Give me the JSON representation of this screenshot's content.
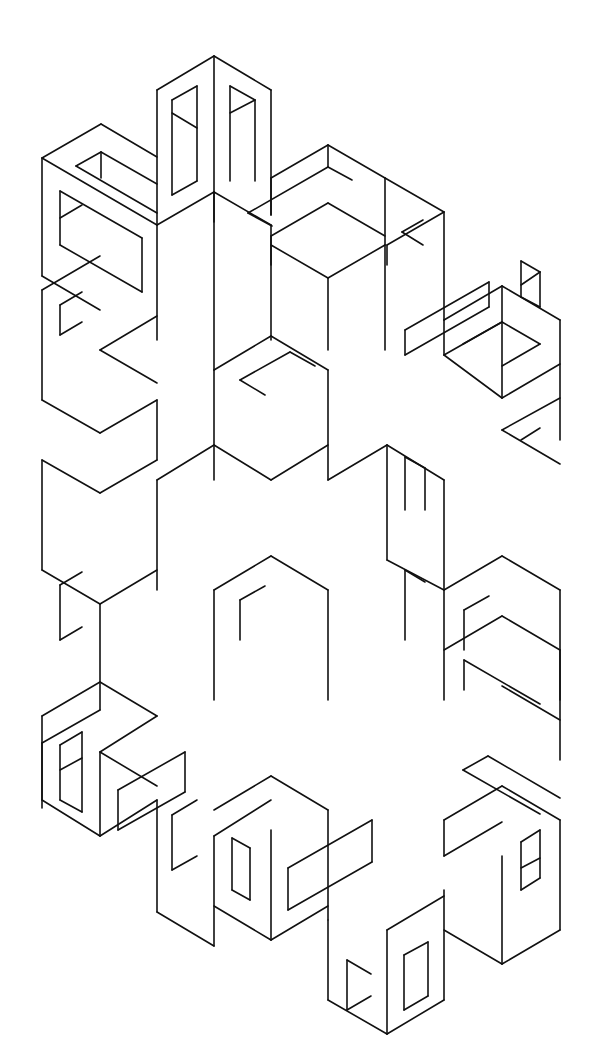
{
  "artwork": {
    "subject": "isometric impossible interlocking open-frame blocks",
    "style": "black line art on white",
    "colors": {
      "background": "#ffffff",
      "stroke": "#111111"
    },
    "lines": [
      [
        214,
        56,
        157,
        90
      ],
      [
        214,
        56,
        271,
        90
      ],
      [
        214,
        56,
        214,
        222
      ],
      [
        157,
        90,
        157,
        225
      ],
      [
        271,
        90,
        271,
        215
      ],
      [
        172,
        100,
        197,
        86
      ],
      [
        172,
        100,
        172,
        195
      ],
      [
        172,
        195,
        197,
        181
      ],
      [
        197,
        86,
        197,
        181
      ],
      [
        172,
        113,
        197,
        128
      ],
      [
        230,
        86,
        255,
        100
      ],
      [
        230,
        86,
        230,
        181
      ],
      [
        255,
        100,
        255,
        181
      ],
      [
        230,
        113,
        255,
        100
      ],
      [
        42,
        158,
        101,
        124
      ],
      [
        101,
        124,
        157,
        157
      ],
      [
        42,
        158,
        42,
        276
      ],
      [
        42,
        158,
        157,
        225
      ],
      [
        42,
        276,
        100,
        310
      ],
      [
        76,
        166,
        101,
        152
      ],
      [
        101,
        152,
        157,
        184
      ],
      [
        76,
        166,
        157,
        213
      ],
      [
        101,
        152,
        101,
        178
      ],
      [
        60,
        191,
        60,
        245
      ],
      [
        60,
        191,
        142,
        238
      ],
      [
        60,
        245,
        142,
        292
      ],
      [
        142,
        238,
        142,
        292
      ],
      [
        60,
        218,
        82,
        205
      ],
      [
        157,
        225,
        214,
        192
      ],
      [
        214,
        192,
        271,
        225
      ],
      [
        157,
        225,
        157,
        340
      ],
      [
        271,
        225,
        271,
        340
      ],
      [
        214,
        192,
        214,
        370
      ],
      [
        328,
        145,
        385,
        178
      ],
      [
        271,
        178,
        328,
        145
      ],
      [
        271,
        178,
        271,
        215
      ],
      [
        385,
        178,
        444,
        212
      ],
      [
        385,
        178,
        385,
        245
      ],
      [
        248,
        213,
        328,
        167
      ],
      [
        248,
        213,
        272,
        226
      ],
      [
        328,
        167,
        352,
        180
      ],
      [
        328,
        167,
        328,
        145
      ],
      [
        271,
        236,
        328,
        203
      ],
      [
        328,
        203,
        385,
        236
      ],
      [
        271,
        236,
        271,
        265
      ],
      [
        385,
        245,
        328,
        278
      ],
      [
        328,
        278,
        271,
        245
      ],
      [
        328,
        278,
        328,
        350
      ],
      [
        385,
        245,
        385,
        350
      ],
      [
        444,
        212,
        444,
        320
      ],
      [
        387,
        245,
        444,
        212
      ],
      [
        387,
        245,
        387,
        265
      ],
      [
        402,
        232,
        423,
        220
      ],
      [
        402,
        232,
        423,
        245
      ],
      [
        444,
        320,
        502,
        286
      ],
      [
        502,
        286,
        560,
        320
      ],
      [
        560,
        320,
        560,
        440
      ],
      [
        502,
        286,
        502,
        398
      ],
      [
        405,
        330,
        489,
        282
      ],
      [
        405,
        330,
        405,
        355
      ],
      [
        405,
        355,
        489,
        307
      ],
      [
        489,
        282,
        489,
        307
      ],
      [
        521,
        261,
        540,
        272
      ],
      [
        521,
        261,
        521,
        297
      ],
      [
        521,
        297,
        540,
        307
      ],
      [
        540,
        272,
        540,
        307
      ],
      [
        521,
        285,
        540,
        272
      ],
      [
        444,
        320,
        444,
        355
      ],
      [
        444,
        355,
        502,
        398
      ],
      [
        502,
        398,
        560,
        364
      ],
      [
        463,
        344,
        502,
        322
      ],
      [
        502,
        322,
        540,
        344
      ],
      [
        502,
        366,
        540,
        344
      ],
      [
        42,
        290,
        42,
        400
      ],
      [
        42,
        400,
        100,
        433
      ],
      [
        100,
        433,
        157,
        400
      ],
      [
        42,
        290,
        100,
        256
      ],
      [
        60,
        305,
        82,
        292
      ],
      [
        60,
        305,
        60,
        335
      ],
      [
        60,
        335,
        82,
        322
      ],
      [
        100,
        350,
        157,
        316
      ],
      [
        100,
        350,
        157,
        383
      ],
      [
        157,
        400,
        157,
        460
      ],
      [
        157,
        460,
        100,
        493
      ],
      [
        100,
        493,
        42,
        460
      ],
      [
        42,
        460,
        42,
        570
      ],
      [
        214,
        370,
        271,
        336
      ],
      [
        271,
        336,
        328,
        370
      ],
      [
        214,
        370,
        214,
        480
      ],
      [
        328,
        370,
        328,
        480
      ],
      [
        240,
        380,
        290,
        352
      ],
      [
        240,
        380,
        265,
        395
      ],
      [
        290,
        352,
        315,
        366
      ],
      [
        328,
        480,
        387,
        445
      ],
      [
        387,
        445,
        444,
        480
      ],
      [
        444,
        480,
        444,
        590
      ],
      [
        387,
        445,
        387,
        560
      ],
      [
        405,
        457,
        425,
        468
      ],
      [
        405,
        457,
        405,
        510
      ],
      [
        425,
        468,
        425,
        510
      ],
      [
        444,
        355,
        502,
        322
      ],
      [
        502,
        430,
        560,
        398
      ],
      [
        502,
        430,
        560,
        464
      ],
      [
        521,
        440,
        540,
        428
      ],
      [
        271,
        480,
        328,
        445
      ],
      [
        271,
        480,
        214,
        445
      ],
      [
        214,
        445,
        157,
        480
      ],
      [
        157,
        480,
        157,
        590
      ],
      [
        42,
        570,
        100,
        604
      ],
      [
        100,
        604,
        157,
        570
      ],
      [
        60,
        585,
        82,
        572
      ],
      [
        60,
        585,
        60,
        640
      ],
      [
        60,
        640,
        82,
        627
      ],
      [
        100,
        604,
        100,
        710
      ],
      [
        100,
        710,
        42,
        743
      ],
      [
        42,
        743,
        42,
        808
      ],
      [
        214,
        590,
        271,
        556
      ],
      [
        271,
        556,
        328,
        590
      ],
      [
        214,
        590,
        214,
        700
      ],
      [
        328,
        590,
        328,
        700
      ],
      [
        240,
        600,
        265,
        586
      ],
      [
        240,
        600,
        240,
        640
      ],
      [
        387,
        560,
        444,
        590
      ],
      [
        444,
        590,
        502,
        556
      ],
      [
        502,
        556,
        560,
        590
      ],
      [
        560,
        590,
        560,
        700
      ],
      [
        405,
        570,
        425,
        582
      ],
      [
        405,
        570,
        405,
        640
      ],
      [
        444,
        590,
        444,
        700
      ],
      [
        464,
        610,
        489,
        596
      ],
      [
        464,
        610,
        464,
        650
      ],
      [
        42,
        716,
        100,
        682
      ],
      [
        100,
        682,
        157,
        716
      ],
      [
        42,
        716,
        42,
        800
      ],
      [
        42,
        800,
        100,
        836
      ],
      [
        100,
        836,
        157,
        800
      ],
      [
        60,
        745,
        82,
        732
      ],
      [
        60,
        745,
        60,
        800
      ],
      [
        60,
        800,
        82,
        812
      ],
      [
        82,
        732,
        82,
        812
      ],
      [
        60,
        770,
        82,
        758
      ],
      [
        100,
        752,
        100,
        836
      ],
      [
        100,
        752,
        157,
        716
      ],
      [
        100,
        752,
        157,
        786
      ],
      [
        118,
        790,
        185,
        752
      ],
      [
        118,
        790,
        118,
        830
      ],
      [
        118,
        830,
        185,
        792
      ],
      [
        185,
        752,
        185,
        792
      ],
      [
        157,
        800,
        157,
        912
      ],
      [
        157,
        912,
        214,
        946
      ],
      [
        214,
        946,
        214,
        836
      ],
      [
        214,
        836,
        271,
        800
      ],
      [
        172,
        815,
        197,
        800
      ],
      [
        172,
        815,
        172,
        870
      ],
      [
        172,
        870,
        197,
        856
      ],
      [
        214,
        810,
        271,
        776
      ],
      [
        271,
        776,
        328,
        810
      ],
      [
        328,
        810,
        328,
        920
      ],
      [
        232,
        838,
        250,
        848
      ],
      [
        232,
        838,
        232,
        890
      ],
      [
        232,
        890,
        250,
        900
      ],
      [
        250,
        848,
        250,
        900
      ],
      [
        271,
        940,
        214,
        906
      ],
      [
        271,
        940,
        328,
        906
      ],
      [
        271,
        940,
        271,
        830
      ],
      [
        288,
        868,
        372,
        820
      ],
      [
        288,
        868,
        288,
        910
      ],
      [
        288,
        910,
        372,
        862
      ],
      [
        372,
        820,
        372,
        862
      ],
      [
        328,
        920,
        328,
        1000
      ],
      [
        328,
        1000,
        387,
        1034
      ],
      [
        387,
        1034,
        444,
        1000
      ],
      [
        444,
        1000,
        444,
        890
      ],
      [
        347,
        960,
        371,
        974
      ],
      [
        347,
        960,
        347,
        1010
      ],
      [
        347,
        1010,
        371,
        996
      ],
      [
        404,
        955,
        428,
        942
      ],
      [
        404,
        955,
        404,
        1010
      ],
      [
        404,
        1010,
        428,
        996
      ],
      [
        428,
        942,
        428,
        996
      ],
      [
        387,
        930,
        387,
        1034
      ],
      [
        387,
        930,
        444,
        896
      ],
      [
        444,
        820,
        502,
        786
      ],
      [
        502,
        786,
        560,
        820
      ],
      [
        560,
        820,
        560,
        930
      ],
      [
        560,
        930,
        502,
        964
      ],
      [
        502,
        964,
        444,
        930
      ],
      [
        521,
        842,
        540,
        830
      ],
      [
        521,
        842,
        521,
        890
      ],
      [
        521,
        890,
        540,
        878
      ],
      [
        540,
        830,
        540,
        878
      ],
      [
        521,
        868,
        540,
        858
      ],
      [
        502,
        856,
        502,
        964
      ],
      [
        444,
        856,
        502,
        822
      ],
      [
        444,
        820,
        444,
        856
      ],
      [
        463,
        770,
        540,
        814
      ],
      [
        463,
        770,
        488,
        756
      ],
      [
        488,
        756,
        560,
        798
      ],
      [
        444,
        650,
        502,
        616
      ],
      [
        502,
        616,
        560,
        650
      ],
      [
        560,
        650,
        560,
        760
      ],
      [
        502,
        686,
        560,
        720
      ],
      [
        464,
        660,
        540,
        704
      ],
      [
        464,
        660,
        464,
        690
      ]
    ]
  }
}
